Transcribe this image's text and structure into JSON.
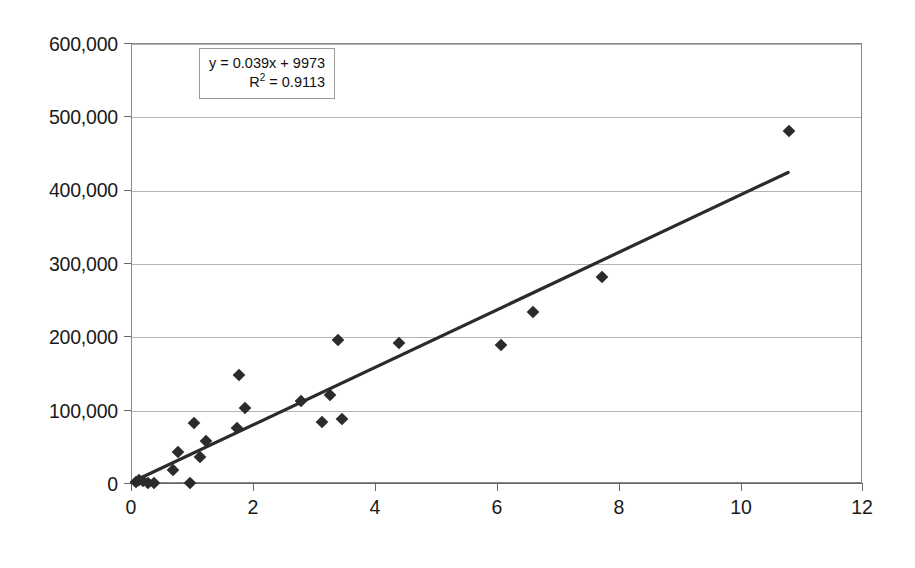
{
  "chart_data": {
    "type": "scatter",
    "title": "",
    "subtitle": "",
    "xlabel": "",
    "ylabel": "",
    "xlim": [
      0,
      12
    ],
    "ylim": [
      0,
      600000
    ],
    "grid": true,
    "legend": false,
    "x_ticks": [
      "0",
      "2",
      "4",
      "6",
      "8",
      "10",
      "12"
    ],
    "x_tick_values": [
      0,
      2,
      4,
      6,
      8,
      10,
      12
    ],
    "y_ticks": [
      "0",
      "100,000",
      "200,000",
      "300,000",
      "400,000",
      "500,000",
      "600,000"
    ],
    "y_tick_values": [
      0,
      100000,
      200000,
      300000,
      400000,
      500000,
      600000
    ],
    "marker_shape": "diamond",
    "marker_color": "#2b2b2b",
    "points": [
      {
        "x": 0.06,
        "y": 3000
      },
      {
        "x": 0.12,
        "y": 6000
      },
      {
        "x": 0.18,
        "y": 4000
      },
      {
        "x": 0.26,
        "y": 2000
      },
      {
        "x": 0.36,
        "y": 1000
      },
      {
        "x": 0.68,
        "y": 19000
      },
      {
        "x": 0.75,
        "y": 44000
      },
      {
        "x": 0.95,
        "y": 1000
      },
      {
        "x": 1.02,
        "y": 83000
      },
      {
        "x": 1.12,
        "y": 37000
      },
      {
        "x": 1.22,
        "y": 58000
      },
      {
        "x": 1.72,
        "y": 76000
      },
      {
        "x": 1.76,
        "y": 148000
      },
      {
        "x": 1.86,
        "y": 104000
      },
      {
        "x": 2.78,
        "y": 113000
      },
      {
        "x": 3.12,
        "y": 85000
      },
      {
        "x": 3.25,
        "y": 122000
      },
      {
        "x": 3.38,
        "y": 196000
      },
      {
        "x": 3.45,
        "y": 88000
      },
      {
        "x": 4.38,
        "y": 192000
      },
      {
        "x": 6.05,
        "y": 189000
      },
      {
        "x": 6.58,
        "y": 235000
      },
      {
        "x": 7.72,
        "y": 282000
      },
      {
        "x": 10.78,
        "y": 481000
      }
    ],
    "trendline": {
      "type": "linear",
      "slope": 0.039,
      "intercept": 9973,
      "r_squared": 0.9113,
      "equation_text": "y = 0.039x + 9973",
      "r2_prefix": "R",
      "r2_exponent": "2",
      "r2_text": " = 0.9113",
      "color": "#2b2b2b",
      "x_start": 0.0,
      "y_start": 0,
      "x_end": 10.8,
      "y_end": 424000
    }
  }
}
